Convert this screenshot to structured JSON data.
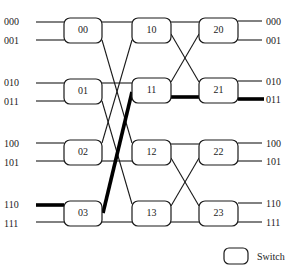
{
  "diagram": {
    "type": "multistage-interconnection-network",
    "inputs": [
      "000",
      "001",
      "010",
      "011",
      "100",
      "101",
      "110",
      "111"
    ],
    "outputs": [
      "000",
      "001",
      "010",
      "011",
      "100",
      "101",
      "110",
      "111"
    ],
    "stages": [
      {
        "switches": [
          "00",
          "01",
          "02",
          "03"
        ]
      },
      {
        "switches": [
          "10",
          "11",
          "12",
          "13"
        ]
      },
      {
        "switches": [
          "20",
          "21",
          "22",
          "23"
        ]
      }
    ],
    "highlighted_path": {
      "from_input": "110",
      "to_output": "011",
      "via": [
        "03",
        "11",
        "21"
      ]
    },
    "legend": {
      "label": "Switch"
    },
    "colors": {
      "line": "#1a1a1a",
      "highlight": "#000000",
      "background": "#ffffff"
    }
  }
}
